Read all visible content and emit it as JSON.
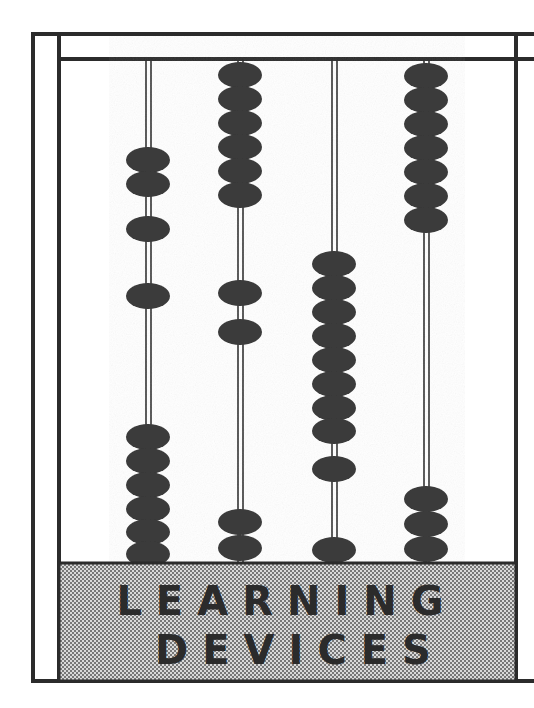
{
  "illustration": {
    "subject": "abacus",
    "style": "high-contrast black and white line art with halftone gray band",
    "colors": {
      "ink": "#2b2b2b",
      "bead": "#3a3a3a",
      "paper": "#ffffff",
      "band_gray": "#b3b3b3",
      "band_dither_dark": "#555555"
    }
  },
  "caption": {
    "line1": "LEARNING",
    "line2": "DEVICES"
  },
  "frame": {
    "outer": {
      "x": 31,
      "y": 32,
      "width": 487,
      "height": 651,
      "stroke": 4
    },
    "inner": {
      "x": 57,
      "y": 32,
      "width": 461,
      "height": 651,
      "stroke": 4
    },
    "top_rail_y": 57,
    "band": {
      "x": 59,
      "y": 563,
      "width": 457,
      "height": 118
    }
  },
  "abacus": {
    "rod_count": 4,
    "bead_width": 44,
    "bead_height": 25,
    "rod_line_gap": 4,
    "rods": [
      {
        "id": "rod-1",
        "x": 148,
        "top": 59,
        "bottom": 563,
        "bead_count": 10,
        "clusters": [
          {
            "name": "upper-pair",
            "count": 2,
            "start_y": 148
          },
          {
            "name": "single-a",
            "count": 1,
            "start_y": 212
          },
          {
            "name": "single-b",
            "count": 1,
            "start_y": 283
          },
          {
            "name": "lower-six",
            "count": 6,
            "start_y": 425
          }
        ]
      },
      {
        "id": "rod-2",
        "x": 240,
        "top": 59,
        "bottom": 563,
        "bead_count": 10,
        "clusters": [
          {
            "name": "upper-six",
            "count": 6,
            "start_y": 64
          },
          {
            "name": "single-a",
            "count": 1,
            "start_y": 283
          },
          {
            "name": "single-b",
            "count": 1,
            "start_y": 330
          },
          {
            "name": "lower-pair",
            "count": 2,
            "start_y": 510
          }
        ]
      },
      {
        "id": "rod-3",
        "x": 334,
        "top": 59,
        "bottom": 563,
        "bead_count": 10,
        "clusters": [
          {
            "name": "middle-eight",
            "count": 8,
            "start_y": 252
          },
          {
            "name": "single-a",
            "count": 1,
            "start_y": 457
          },
          {
            "name": "single-b",
            "count": 1,
            "start_y": 537
          }
        ]
      },
      {
        "id": "rod-4",
        "x": 426,
        "top": 59,
        "bottom": 563,
        "bead_count": 10,
        "clusters": [
          {
            "name": "upper-seven",
            "count": 7,
            "start_y": 64
          },
          {
            "name": "lower-three",
            "count": 3,
            "start_y": 487
          }
        ]
      }
    ]
  }
}
